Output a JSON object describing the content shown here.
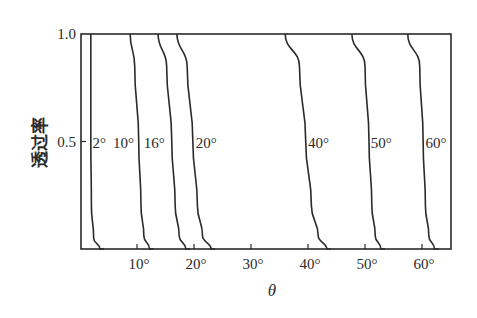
{
  "chart_data": {
    "type": "line",
    "title": "",
    "xlabel": "θ",
    "ylabel": "透过率",
    "xlim": [
      0,
      65
    ],
    "ylim": [
      0,
      1.0
    ],
    "grid": false,
    "legend": "none (inline curve labels)",
    "x_ticks": [
      {
        "value": 10,
        "label": "10°"
      },
      {
        "value": 20,
        "label": "20°"
      },
      {
        "value": 30,
        "label": "30°"
      },
      {
        "value": 40,
        "label": "40°"
      },
      {
        "value": 50,
        "label": "50°"
      },
      {
        "value": 60,
        "label": "60°"
      }
    ],
    "y_ticks": [
      {
        "value": 0.5,
        "label": "0.5"
      },
      {
        "value": 1.0,
        "label": "1.0"
      }
    ],
    "series": [
      {
        "name": "2°",
        "label": "2°",
        "x": [
          1.9,
          1.9,
          1.9,
          2.0,
          2.4,
          3.5
        ],
        "y": [
          1.0,
          0.75,
          0.5,
          0.2,
          0.05,
          0.0
        ]
      },
      {
        "name": "10°",
        "label": "10°",
        "x": [
          8.8,
          9.6,
          10.3,
          10.7,
          11.2,
          12.2
        ],
        "y": [
          1.0,
          0.85,
          0.5,
          0.2,
          0.06,
          0.0
        ]
      },
      {
        "name": "16°",
        "label": "16°",
        "x": [
          13.7,
          15.2,
          16.1,
          16.7,
          17.4,
          18.6
        ],
        "y": [
          1.0,
          0.85,
          0.5,
          0.2,
          0.06,
          0.0
        ]
      },
      {
        "name": "20°",
        "label": "20°",
        "x": [
          17.0,
          18.8,
          19.8,
          20.6,
          21.5,
          23.0
        ],
        "y": [
          1.0,
          0.85,
          0.5,
          0.2,
          0.06,
          0.0
        ]
      },
      {
        "name": "40°",
        "label": "40°",
        "x": [
          36.0,
          38.5,
          39.6,
          40.6,
          41.8,
          43.3
        ],
        "y": [
          1.0,
          0.85,
          0.5,
          0.2,
          0.06,
          0.0
        ]
      },
      {
        "name": "50°",
        "label": "50°",
        "x": [
          47.7,
          50.0,
          50.7,
          51.2,
          51.8,
          52.8
        ],
        "y": [
          1.0,
          0.85,
          0.5,
          0.2,
          0.06,
          0.0
        ]
      },
      {
        "name": "60°",
        "label": "60°",
        "x": [
          57.5,
          59.6,
          60.2,
          60.6,
          61.2,
          62.2
        ],
        "y": [
          1.0,
          0.85,
          0.5,
          0.2,
          0.06,
          0.0
        ]
      }
    ],
    "annotations": [
      {
        "text": "2°",
        "x": 2.2,
        "y": 0.5
      },
      {
        "text": "10°",
        "x": 5.8,
        "y": 0.5
      },
      {
        "text": "16°",
        "x": 11.2,
        "y": 0.5
      },
      {
        "text": "20°",
        "x": 20.3,
        "y": 0.5
      },
      {
        "text": "40°",
        "x": 40.0,
        "y": 0.5
      },
      {
        "text": "50°",
        "x": 51.0,
        "y": 0.5
      },
      {
        "text": "60°",
        "x": 60.6,
        "y": 0.5
      }
    ]
  },
  "layout": {
    "plot": {
      "left": 81,
      "right": 451,
      "top": 34,
      "bottom": 249
    },
    "x_origin_px": 80,
    "px_per_degree": 5.7,
    "line_color": "#2a2a2a"
  }
}
